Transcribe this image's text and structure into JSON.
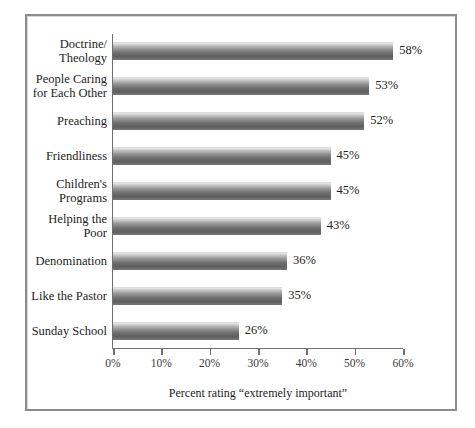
{
  "figure": {
    "top_fragment": "• • • • • •",
    "frame_color": "#8c8c8c",
    "background": "#ffffff"
  },
  "axis": {
    "caption": "Percent rating “extremely important”",
    "tick_labels": [
      "0%",
      "10%",
      "20%",
      "30%",
      "40%",
      "50%",
      "60%"
    ]
  },
  "chart_data": {
    "type": "bar",
    "orientation": "horizontal",
    "title": "",
    "subtitle": "",
    "xlabel": "Percent rating “extremely important”",
    "ylabel": "",
    "xlim": [
      0,
      60
    ],
    "xticks": [
      0,
      10,
      20,
      30,
      40,
      50,
      60
    ],
    "xtick_labels": [
      "0%",
      "10%",
      "20%",
      "30%",
      "40%",
      "50%",
      "60%"
    ],
    "grid": false,
    "legend": false,
    "bar_color": "#6f6f6f",
    "value_suffix": "%",
    "categories": [
      "Doctrine/\nTheology",
      "People Caring\nfor Each Other",
      "Preaching",
      "Friendliness",
      "Children's\nPrograms",
      "Helping the\nPoor",
      "Denomination",
      "Like the Pastor",
      "Sunday School"
    ],
    "values": [
      58,
      53,
      52,
      45,
      45,
      43,
      36,
      35,
      26
    ],
    "value_labels": [
      "58%",
      "53%",
      "52%",
      "45%",
      "45%",
      "43%",
      "36%",
      "35%",
      "26%"
    ]
  }
}
